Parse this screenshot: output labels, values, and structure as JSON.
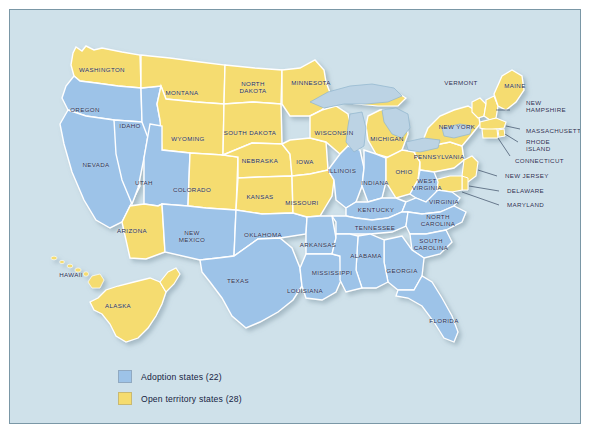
{
  "title_fragment": "",
  "colors": {
    "adoption_blue": "#9dc3e8",
    "open_yellow": "#f5dc6f",
    "ocean": "#cfe1ea",
    "lakes": "#bcd3e4",
    "border_line": "#ffffff",
    "frame_border": "#7a97a6",
    "label_text": "#1d2a4d",
    "title_text": "#c04a52"
  },
  "legend": {
    "items": [
      {
        "label": "Adoption states (22)",
        "color_key": "adoption_blue",
        "swatch": "#9dc3e8"
      },
      {
        "label": "Open territory states (28)",
        "color_key": "open_yellow",
        "swatch": "#f5dc6f"
      }
    ]
  },
  "map": {
    "categories": {
      "adoption": "Adoption states",
      "open_territory": "Open territory states"
    },
    "counts": {
      "adoption": 22,
      "open_territory": 28
    },
    "states": [
      {
        "name": "WASHINGTON",
        "category": "open_territory",
        "x": 92,
        "y": 59,
        "lines": [
          "WASHINGTON"
        ]
      },
      {
        "name": "OREGON",
        "category": "adoption",
        "x": 75,
        "y": 99,
        "lines": [
          "OREGON"
        ]
      },
      {
        "name": "IDAHO",
        "category": "adoption",
        "x": 120,
        "y": 115,
        "lines": [
          "IDAHO"
        ]
      },
      {
        "name": "MONTANA",
        "category": "open_territory",
        "x": 172,
        "y": 82,
        "lines": [
          "MONTANA"
        ]
      },
      {
        "name": "NORTH DAKOTA",
        "category": "open_territory",
        "x": 243,
        "y": 77,
        "lines": [
          "NORTH",
          "DAKOTA"
        ]
      },
      {
        "name": "MINNESOTA",
        "category": "open_territory",
        "x": 301,
        "y": 72,
        "lines": [
          "MINNESOTA"
        ]
      },
      {
        "name": "WISCONSIN",
        "category": "open_territory",
        "x": 324,
        "y": 122,
        "lines": [
          "WISCONSIN"
        ]
      },
      {
        "name": "MICHIGAN",
        "category": "open_territory",
        "x": 377,
        "y": 128,
        "lines": [
          "MICHIGAN"
        ]
      },
      {
        "name": "SOUTH DAKOTA",
        "category": "open_territory",
        "x": 240,
        "y": 122,
        "lines": [
          "SOUTH DAKOTA"
        ]
      },
      {
        "name": "WYOMING",
        "category": "open_territory",
        "x": 178,
        "y": 128,
        "lines": [
          "WYOMING"
        ]
      },
      {
        "name": "NEVADA",
        "category": "adoption",
        "x": 86,
        "y": 154,
        "lines": [
          "NEVADA"
        ]
      },
      {
        "name": "UTAH",
        "category": "adoption",
        "x": 134,
        "y": 172,
        "lines": [
          "UTAH"
        ]
      },
      {
        "name": "COLORADO",
        "category": "open_territory",
        "x": 182,
        "y": 179,
        "lines": [
          "COLORADO"
        ]
      },
      {
        "name": "NEBRASKA",
        "category": "open_territory",
        "x": 250,
        "y": 150,
        "lines": [
          "NEBRASKA"
        ]
      },
      {
        "name": "IOWA",
        "category": "open_territory",
        "x": 295,
        "y": 151,
        "lines": [
          "IOWA"
        ]
      },
      {
        "name": "ILLINOIS",
        "category": "adoption",
        "x": 332,
        "y": 160,
        "lines": [
          "ILLINOIS"
        ]
      },
      {
        "name": "INDIANA",
        "category": "adoption",
        "x": 365,
        "y": 172,
        "lines": [
          "INDIANA"
        ]
      },
      {
        "name": "OHIO",
        "category": "open_territory",
        "x": 394,
        "y": 161,
        "lines": [
          "OHIO"
        ]
      },
      {
        "name": "KANSAS",
        "category": "open_territory",
        "x": 250,
        "y": 186,
        "lines": [
          "KANSAS"
        ]
      },
      {
        "name": "MISSOURI",
        "category": "open_territory",
        "x": 292,
        "y": 192,
        "lines": [
          "MISSOURI"
        ]
      },
      {
        "name": "KENTUCKY",
        "category": "adoption",
        "x": 366,
        "y": 199,
        "lines": [
          "KENTUCKY"
        ]
      },
      {
        "name": "WEST VIRGINIA",
        "category": "adoption",
        "x": 417,
        "y": 174,
        "lines": [
          "WEST",
          "VIRGINIA"
        ]
      },
      {
        "name": "VIRGINIA",
        "category": "adoption",
        "x": 434,
        "y": 191,
        "lines": [
          "VIRGINIA"
        ]
      },
      {
        "name": "PENNSYLVANIA",
        "category": "open_territory",
        "x": 429,
        "y": 146,
        "lines": [
          "PENNSYLVANIA"
        ]
      },
      {
        "name": "NEW YORK",
        "category": "open_territory",
        "x": 447,
        "y": 116,
        "lines": [
          "NEW YORK"
        ]
      },
      {
        "name": "VERMONT",
        "category": "open_territory",
        "x": 451,
        "y": 72,
        "lines": [
          "VERMONT"
        ]
      },
      {
        "name": "MAINE",
        "category": "open_territory",
        "x": 505,
        "y": 75,
        "lines": [
          "MAINE"
        ]
      },
      {
        "name": "ARIZONA",
        "category": "open_territory",
        "x": 122,
        "y": 220,
        "lines": [
          "ARIZONA"
        ]
      },
      {
        "name": "NEW MEXICO",
        "category": "adoption",
        "x": 182,
        "y": 226,
        "lines": [
          "NEW",
          "MEXICO"
        ]
      },
      {
        "name": "OKLAHOMA",
        "category": "adoption",
        "x": 253,
        "y": 224,
        "lines": [
          "OKLAHOMA"
        ]
      },
      {
        "name": "ARKANSAS",
        "category": "adoption",
        "x": 308,
        "y": 234,
        "lines": [
          "ARKANSAS"
        ]
      },
      {
        "name": "TENNESSEE",
        "category": "adoption",
        "x": 365,
        "y": 217,
        "lines": [
          "TENNESSEE"
        ]
      },
      {
        "name": "NORTH CAROLINA",
        "category": "adoption",
        "x": 428,
        "y": 210,
        "lines": [
          "NORTH",
          "CAROLINA"
        ]
      },
      {
        "name": "SOUTH CAROLINA",
        "category": "adoption",
        "x": 421,
        "y": 234,
        "lines": [
          "SOUTH",
          "CAROLINA"
        ]
      },
      {
        "name": "ALABAMA",
        "category": "adoption",
        "x": 356,
        "y": 245,
        "lines": [
          "ALABAMA"
        ]
      },
      {
        "name": "MISSISSIPPI",
        "category": "adoption",
        "x": 322,
        "y": 262,
        "lines": [
          "MISSISSIPPI"
        ]
      },
      {
        "name": "GEORGIA",
        "category": "adoption",
        "x": 392,
        "y": 260,
        "lines": [
          "GEORGIA"
        ]
      },
      {
        "name": "LOUISIANA",
        "category": "adoption",
        "x": 295,
        "y": 280,
        "lines": [
          "LOUISIANA"
        ]
      },
      {
        "name": "TEXAS",
        "category": "adoption",
        "x": 228,
        "y": 270,
        "lines": [
          "TEXAS"
        ]
      },
      {
        "name": "FLORIDA",
        "category": "adoption",
        "x": 434,
        "y": 310,
        "lines": [
          "FLORIDA"
        ]
      },
      {
        "name": "ALASKA",
        "category": "open_territory",
        "x": 108,
        "y": 295,
        "lines": [
          "ALASKA"
        ]
      },
      {
        "name": "HAWAII",
        "category": "open_territory",
        "x": 61,
        "y": 264,
        "lines": [
          "HAWAII"
        ]
      }
    ],
    "callout_labels": [
      {
        "name": "NEW HAMPSHIRE",
        "x": 516,
        "y": 96,
        "lines": [
          "NEW",
          "HAMPSHIRE"
        ]
      },
      {
        "name": "MASSACHUSETTS",
        "x": 516,
        "y": 120,
        "lines": [
          "MASSACHUSETTS"
        ]
      },
      {
        "name": "RHODE ISLAND",
        "x": 516,
        "y": 135,
        "lines": [
          "RHODE",
          "ISLAND"
        ]
      },
      {
        "name": "CONNECTICUT",
        "x": 505,
        "y": 150,
        "lines": [
          "CONNECTICUT"
        ]
      },
      {
        "name": "NEW JERSEY",
        "x": 495,
        "y": 165,
        "lines": [
          "NEW JERSEY"
        ]
      },
      {
        "name": "DELAWARE",
        "x": 497,
        "y": 180,
        "lines": [
          "DELAWARE"
        ]
      },
      {
        "name": "MARYLAND",
        "x": 497,
        "y": 194,
        "lines": [
          "MARYLAND"
        ]
      }
    ]
  }
}
